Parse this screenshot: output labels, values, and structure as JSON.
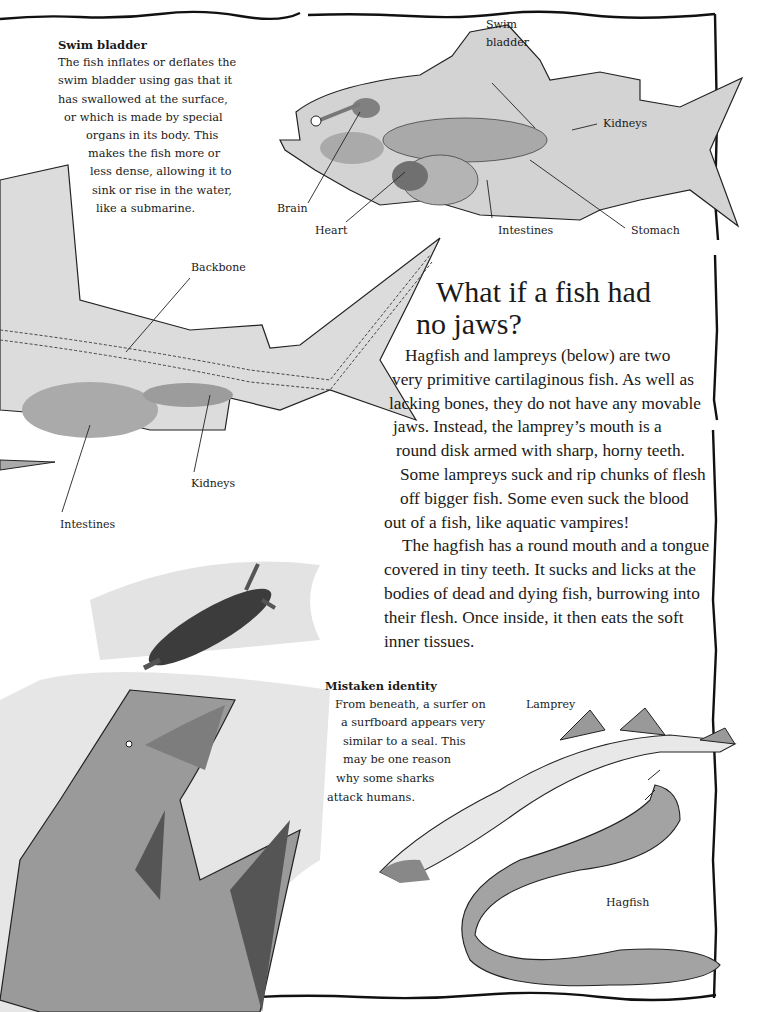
{
  "page": {
    "background": "#ffffff",
    "ink": "#1a1a1a",
    "wash_gray": "#bdbdbd"
  },
  "swim_bladder_box": {
    "title": "Swim bladder",
    "lines": [
      "The fish inflates or deflates the",
      "swim bladder using gas that it",
      "has swallowed at the surface,",
      "or which is made by special",
      "organs in its body. This",
      "makes the fish more or",
      "less dense, allowing it to",
      "sink or rise in the water,",
      "like a submarine."
    ]
  },
  "bony_fish_diagram": {
    "labels": {
      "swim_bladder": [
        "Swim",
        "bladder"
      ],
      "kidneys": "Kidneys",
      "brain": "Brain",
      "heart": "Heart",
      "intestines": "Intestines",
      "stomach": "Stomach"
    }
  },
  "shark_diagram": {
    "labels": {
      "backbone": "Backbone",
      "kidneys": "Kidneys",
      "intestines": "Intestines"
    }
  },
  "main_article": {
    "heading": [
      "What if a fish had",
      "no jaws?"
    ],
    "lines": [
      "Hagfish and lampreys (below) are two",
      "very primitive cartilaginous fish. As well as",
      "lacking bones, they do not have any movable",
      "jaws. Instead, the lamprey’s mouth is a",
      "round disk armed with sharp, horny teeth.",
      "Some lampreys suck and rip chunks of flesh",
      "off bigger fish. Some even suck the blood",
      "out of a fish, like aquatic vampires!",
      "The hagfish has a round mouth and a tongue",
      "covered in tiny teeth. It sucks and licks at the",
      "bodies of dead and dying fish, burrowing into",
      "their flesh. Once inside, it then eats the soft",
      "inner tissues."
    ]
  },
  "mistaken_identity_box": {
    "title": "Mistaken identity",
    "lines": [
      "From beneath, a surfer on",
      "a surfboard appears very",
      "similar to a seal. This",
      "may be one reason",
      "why some sharks",
      "attack humans."
    ]
  },
  "jawless_fish_labels": {
    "lamprey": "Lamprey",
    "hagfish": "Hagfish"
  }
}
